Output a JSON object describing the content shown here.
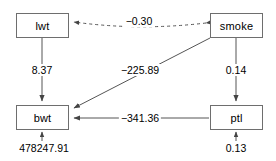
{
  "diagram": {
    "type": "path-diagram",
    "nodes": [
      {
        "id": "lwt",
        "label": "lwt",
        "x": 16,
        "y": 13,
        "w": 53,
        "h": 25
      },
      {
        "id": "smoke",
        "label": "smoke",
        "x": 210,
        "y": 13,
        "w": 53,
        "h": 25
      },
      {
        "id": "bwt",
        "label": "bwt",
        "x": 16,
        "y": 105,
        "w": 53,
        "h": 25
      },
      {
        "id": "ptl",
        "label": "ptl",
        "x": 210,
        "y": 105,
        "w": 53,
        "h": 25
      }
    ],
    "edges": [
      {
        "id": "smoke-lwt",
        "from": "smoke",
        "to": "lwt",
        "label": "−0.30",
        "style": "dashed",
        "arrows": "both",
        "label_x": 139,
        "label_y": 21
      },
      {
        "id": "lwt-bwt",
        "from": "lwt",
        "to": "bwt",
        "label": "8.37",
        "style": "solid",
        "arrows": "end",
        "label_x": 42,
        "label_y": 70
      },
      {
        "id": "smoke-bwt",
        "from": "smoke",
        "to": "bwt",
        "label": "−225.89",
        "style": "solid",
        "arrows": "end",
        "label_x": 140,
        "label_y": 70
      },
      {
        "id": "smoke-ptl",
        "from": "smoke",
        "to": "ptl",
        "label": "0.14",
        "style": "solid",
        "arrows": "end",
        "label_x": 236,
        "label_y": 70
      },
      {
        "id": "ptl-bwt",
        "from": "ptl",
        "to": "bwt",
        "label": "−341.36",
        "style": "solid",
        "arrows": "end",
        "label_x": 140,
        "label_y": 118
      }
    ],
    "residuals": [
      {
        "id": "bwt-residual",
        "node": "bwt",
        "label": "478247.91",
        "label_x": 44,
        "label_y": 148
      },
      {
        "id": "ptl-residual",
        "node": "ptl",
        "label": "0.13",
        "label_x": 236,
        "label_y": 148
      }
    ],
    "colors": {
      "node_border": "#6e6e6e",
      "edge": "#555555",
      "text": "#000000",
      "background": "#ffffff"
    }
  }
}
